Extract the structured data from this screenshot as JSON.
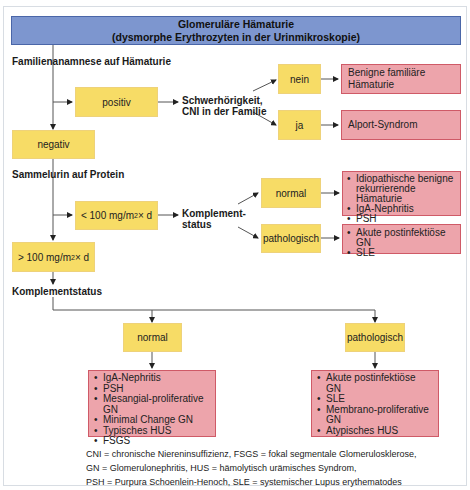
{
  "header": {
    "title": "Glomeruläre Hämaturie",
    "subtitle": "(dysmorphe Erythrozyten in der Urinmikroskopie)"
  },
  "colors": {
    "header_fill": "#7d96cf",
    "decision_fill": "#f7dc66",
    "diagnosis_fill": "#eda4ab",
    "diagnosis_border": "#cf5a67"
  },
  "step1": {
    "label": "Familienanamnese auf Hämaturie",
    "positive": "positiv",
    "negative": "negativ",
    "question": "Schwerhörigkeit,",
    "question_line2": "CNI in der Familie",
    "no": "nein",
    "yes": "ja",
    "no_result": "Benigne familiäre Hämaturie",
    "yes_result": "Alport-Syndrom"
  },
  "step2": {
    "label": "Sammelurin auf Protein",
    "low": {
      "prefix": "< 100 mg/m",
      "sup": "2",
      "suffix": " × d"
    },
    "high": {
      "prefix": "> 100 mg/m",
      "sup": "2",
      "suffix": " × d"
    },
    "complement_label": "Komplement-",
    "complement_label_line2": "status",
    "normal": "normal",
    "pathologic": "pathologisch",
    "normal_results": [
      "Idiopathische benigne rekurrierende Hämaturie",
      "IgA-Nephritis",
      "PSH"
    ],
    "pathologic_results": [
      "Akute postinfektiöse GN",
      "SLE"
    ]
  },
  "step3": {
    "label": "Komplementstatus",
    "normal": "normal",
    "pathologic": "pathologisch",
    "normal_results": [
      "IgA-Nephritis",
      "PSH",
      "Mesangial-proliferative GN",
      "Minimal Change GN",
      "Typisches HUS",
      "FSGS"
    ],
    "pathologic_results": [
      "Akute postinfektiöse GN",
      "SLE",
      "Membrano-proliferative GN",
      "Atypisches HUS"
    ]
  },
  "legend": [
    "CNI = chronische Niereninsuffizienz, FSGS = fokal segmentale Glomerulosklerose,",
    "GN = Glomerulonephritis, HUS = hämolytisch urämisches Syndrom,",
    "PSH = Purpura Schoenlein-Henoch, SLE = systemischer Lupus erythematodes"
  ]
}
